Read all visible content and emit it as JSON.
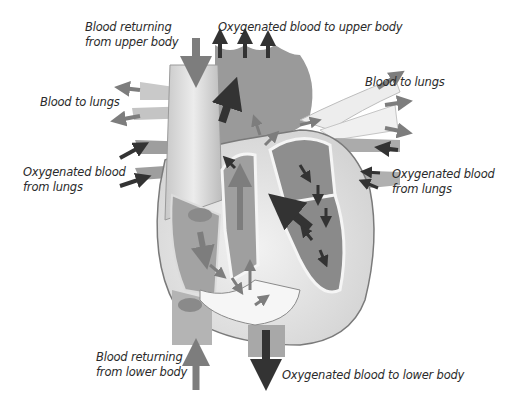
{
  "diagram": {
    "style": "grayscale illustration",
    "colors": {
      "background": "#ffffff",
      "label_text": "#2b2b2b",
      "deoxygenated_vessel": "#b4b4b4",
      "oxygenated_vessel": "#8f8f8f",
      "heart_wall": "#e6e6e6",
      "wall_outline": "#7a7a7a",
      "deoxygenated_arrow": "#7d7d7d",
      "oxygenated_arrow": "#333333"
    },
    "labels": {
      "upper_return": {
        "line1": "Blood returning",
        "line2": "from upper body"
      },
      "upper_oxy": {
        "line1": "Oxygenated blood to upper body"
      },
      "lungs_left": {
        "line1": "Blood to lungs"
      },
      "lungs_right": {
        "line1": "Blood to lungs"
      },
      "oxy_from_lungs_left": {
        "line1": "Oxygenated blood",
        "line2": "from lungs"
      },
      "oxy_from_lungs_right": {
        "line1": "Oxygenated blood",
        "line2": "from lungs"
      },
      "lower_return": {
        "line1": "Blood returning",
        "line2": "from lower body"
      },
      "lower_oxy": {
        "line1": "Oxygenated blood to lower body"
      }
    }
  }
}
